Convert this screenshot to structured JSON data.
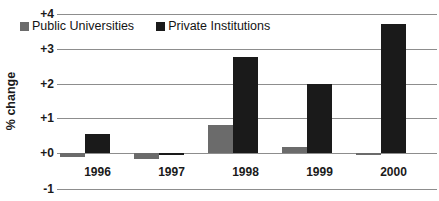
{
  "chart_data": {
    "type": "bar",
    "title": "",
    "subtitle": "",
    "xlabel": "",
    "ylabel": "% change",
    "categories": [
      "1996",
      "1997",
      "1998",
      "1999",
      "2000"
    ],
    "series": [
      {
        "name": "Public Universities",
        "color": "#6b6b6b",
        "values": [
          -0.12,
          -0.18,
          0.8,
          0.17,
          -0.05
        ]
      },
      {
        "name": "Private Institutions",
        "color": "#1a1a1a",
        "values": [
          0.55,
          -0.07,
          2.75,
          2.0,
          3.7
        ]
      }
    ],
    "ylim": [
      -1,
      4
    ],
    "ytick_labels": [
      "+4",
      "+3",
      "+2",
      "+1",
      "+0",
      "-1"
    ],
    "ytick_values": [
      4,
      3,
      2,
      1,
      0,
      -1
    ],
    "grid": true,
    "legend_position": "top-inside",
    "gridline_color": "#8d8d8d",
    "background_color": "#ffffff"
  }
}
